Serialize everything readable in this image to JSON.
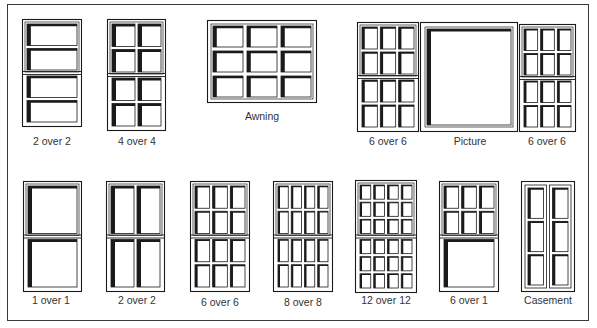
{
  "colors": {
    "ink": "#1a1a1a",
    "border": "#3a3a3a",
    "label": "#333333",
    "paper": "#ffffff"
  },
  "windows": [
    {
      "id": "top-2over2",
      "label": "2 over 2",
      "type": "double-hung",
      "x": 22,
      "y": 19,
      "w": 60,
      "h": 108,
      "upper": {
        "cols": 1,
        "rows": 2
      },
      "lower": {
        "cols": 1,
        "rows": 2
      },
      "label_x": 52,
      "label_y": 137
    },
    {
      "id": "top-4over4",
      "label": "4 over 4",
      "type": "double-hung",
      "x": 107,
      "y": 19,
      "w": 59,
      "h": 112,
      "upper": {
        "cols": 2,
        "rows": 2
      },
      "lower": {
        "cols": 2,
        "rows": 2
      },
      "label_x": 137,
      "label_y": 137
    },
    {
      "id": "awning",
      "label": "Awning",
      "type": "single",
      "x": 207,
      "y": 20,
      "w": 110,
      "h": 83,
      "grid": {
        "cols": 3,
        "rows": 3
      },
      "label_x": 262,
      "label_y": 112
    },
    {
      "id": "top-6over6-left",
      "label": "6 over 6",
      "type": "double-hung",
      "x": 357,
      "y": 22,
      "w": 62,
      "h": 110,
      "upper": {
        "cols": 3,
        "rows": 2
      },
      "lower": {
        "cols": 3,
        "rows": 2
      },
      "label_x": 388,
      "label_y": 137
    },
    {
      "id": "picture",
      "label": "Picture",
      "type": "single",
      "x": 420,
      "y": 22,
      "w": 98,
      "h": 110,
      "grid": {
        "cols": 1,
        "rows": 1
      },
      "label_x": 470,
      "label_y": 137
    },
    {
      "id": "top-6over6-right",
      "label": "6 over 6",
      "type": "double-hung",
      "x": 519,
      "y": 24,
      "w": 57,
      "h": 108,
      "upper": {
        "cols": 3,
        "rows": 2
      },
      "lower": {
        "cols": 3,
        "rows": 2
      },
      "label_x": 547,
      "label_y": 137
    },
    {
      "id": "bottom-1over1",
      "label": "1 over 1",
      "type": "double-hung",
      "x": 23,
      "y": 181,
      "w": 59,
      "h": 111,
      "upper": {
        "cols": 1,
        "rows": 1
      },
      "lower": {
        "cols": 1,
        "rows": 1
      },
      "label_x": 51,
      "label_y": 296
    },
    {
      "id": "bottom-2over2",
      "label": "2 over 2",
      "type": "double-hung",
      "x": 106,
      "y": 181,
      "w": 59,
      "h": 111,
      "upper": {
        "cols": 2,
        "rows": 1
      },
      "lower": {
        "cols": 2,
        "rows": 1
      },
      "label_x": 137,
      "label_y": 296
    },
    {
      "id": "bottom-6over6",
      "label": "6 over 6",
      "type": "double-hung",
      "x": 190,
      "y": 181,
      "w": 60,
      "h": 111,
      "upper": {
        "cols": 3,
        "rows": 2
      },
      "lower": {
        "cols": 3,
        "rows": 2
      },
      "label_x": 220,
      "label_y": 298
    },
    {
      "id": "bottom-8over8",
      "label": "8 over 8",
      "type": "double-hung",
      "x": 273,
      "y": 181,
      "w": 60,
      "h": 111,
      "upper": {
        "cols": 4,
        "rows": 2
      },
      "lower": {
        "cols": 4,
        "rows": 2
      },
      "label_x": 303,
      "label_y": 298
    },
    {
      "id": "bottom-12over12",
      "label": "12 over 12",
      "type": "double-hung",
      "x": 355,
      "y": 180,
      "w": 62,
      "h": 113,
      "upper": {
        "cols": 4,
        "rows": 3
      },
      "lower": {
        "cols": 4,
        "rows": 3
      },
      "label_x": 386,
      "label_y": 296
    },
    {
      "id": "bottom-6over1",
      "label": "6 over 1",
      "type": "double-hung",
      "x": 439,
      "y": 181,
      "w": 60,
      "h": 111,
      "upper": {
        "cols": 3,
        "rows": 2
      },
      "lower": {
        "cols": 1,
        "rows": 1
      },
      "label_x": 469,
      "label_y": 296
    },
    {
      "id": "casement",
      "label": "Casement",
      "type": "casement",
      "x": 521,
      "y": 181,
      "w": 54,
      "h": 111,
      "leaves": 2,
      "rows": 3,
      "label_x": 548,
      "label_y": 296
    }
  ]
}
